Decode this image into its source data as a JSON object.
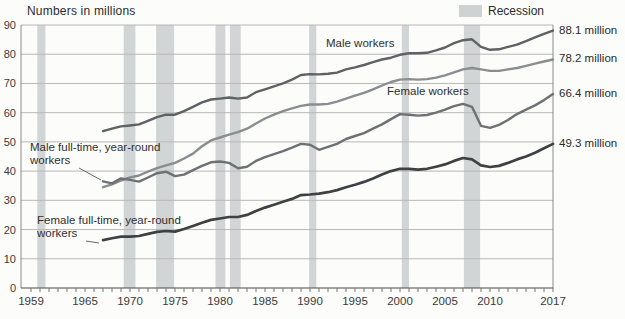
{
  "title": "Numbers in millions",
  "legend": {
    "label": "Recession",
    "swatch_color": "#cfd2d2"
  },
  "labels": {
    "male_workers": "Male workers",
    "female_workers": "Female workers",
    "male_ftyr_l1": "Male full-time, year-round",
    "male_ftyr_l2": "workers",
    "female_ftyr_l1": "Female full-time, year-round",
    "female_ftyr_l2": "workers"
  },
  "colors": {
    "recession_band": "#d2d5d5",
    "gridline": "#b8b8b8",
    "axis": "#8a8a8a",
    "baseline": "#4a4a4a",
    "tick_text": "#3a3a3a",
    "leader": "#6a6a6a"
  },
  "chart_data": {
    "type": "line",
    "title": "Numbers in millions",
    "xlabel": "",
    "ylabel": "Numbers in millions",
    "x_start_year": 1967,
    "x_end_year": 2017,
    "x_axis_start": 1959,
    "x_tick_years": [
      1959,
      1965,
      1970,
      1975,
      1980,
      1985,
      1990,
      1995,
      2000,
      2005,
      2010,
      2017
    ],
    "minor_tick_step": 1,
    "y_ticks": [
      0,
      10,
      20,
      30,
      40,
      50,
      60,
      70,
      80,
      90
    ],
    "ylim": [
      0,
      90
    ],
    "grid": true,
    "legend_position": "top-right",
    "recession_spans": [
      [
        1959.7,
        1960.6
      ],
      [
        1969.3,
        1970.6
      ],
      [
        1972.9,
        1974.9
      ],
      [
        1979.5,
        1980.6
      ],
      [
        1981.1,
        1982.3
      ],
      [
        1989.9,
        1990.7
      ],
      [
        2000.2,
        2001.0
      ],
      [
        2007.1,
        2008.9
      ]
    ],
    "series": [
      {
        "name": "Male workers",
        "end_label": "88.1 million",
        "end_value": 88.1,
        "color": "#5f6264",
        "width": 2.4,
        "values": [
          53.7,
          54.5,
          55.3,
          55.6,
          56.0,
          57.2,
          58.5,
          59.3,
          59.3,
          60.5,
          62.0,
          63.5,
          64.5,
          64.8,
          65.2,
          64.8,
          65.2,
          67.0,
          68.0,
          69.0,
          70.0,
          71.3,
          72.9,
          73.2,
          73.1,
          73.3,
          73.7,
          74.8,
          75.5,
          76.3,
          77.3,
          78.2,
          78.8,
          79.8,
          80.3,
          80.3,
          80.5,
          81.3,
          82.3,
          83.8,
          84.8,
          85.1,
          82.5,
          81.5,
          81.7,
          82.5,
          83.3,
          84.5,
          85.8,
          87.0,
          88.1
        ]
      },
      {
        "name": "Female workers",
        "end_label": "78.2 million",
        "end_value": 78.2,
        "color": "#8a8d8f",
        "width": 2.4,
        "values": [
          34.5,
          35.5,
          36.8,
          37.8,
          38.5,
          39.8,
          41.0,
          42.0,
          42.8,
          44.3,
          46.0,
          48.5,
          50.5,
          51.5,
          52.5,
          53.3,
          54.5,
          56.3,
          58.0,
          59.3,
          60.5,
          61.5,
          62.3,
          62.8,
          62.8,
          63.0,
          63.8,
          64.8,
          65.8,
          66.8,
          68.0,
          69.3,
          70.5,
          71.3,
          71.5,
          71.3,
          71.5,
          72.0,
          72.8,
          73.8,
          74.8,
          75.3,
          74.8,
          74.3,
          74.3,
          74.8,
          75.3,
          76.0,
          76.8,
          77.5,
          78.2
        ]
      },
      {
        "name": "Male full-time, year-round workers",
        "end_label": "66.4 million",
        "end_value": 66.4,
        "color": "#6e7173",
        "width": 2.4,
        "values": [
          36.5,
          35.8,
          37.5,
          37.0,
          36.4,
          37.8,
          39.3,
          39.8,
          38.3,
          38.8,
          40.3,
          41.8,
          43.0,
          43.3,
          42.8,
          41.0,
          41.5,
          43.5,
          44.8,
          45.8,
          46.8,
          48.0,
          49.3,
          49.0,
          47.3,
          48.3,
          49.3,
          51.0,
          52.0,
          53.0,
          54.5,
          56.0,
          57.8,
          59.5,
          59.3,
          59.0,
          59.2,
          60.0,
          61.0,
          62.2,
          63.0,
          62.0,
          55.5,
          54.8,
          55.8,
          57.5,
          59.5,
          61.0,
          62.5,
          64.3,
          66.4
        ]
      },
      {
        "name": "Female full-time, year-round workers",
        "end_label": "49.3 million",
        "end_value": 49.3,
        "color": "#3e4143",
        "width": 2.7,
        "values": [
          16.4,
          17.0,
          17.6,
          17.6,
          17.8,
          18.5,
          19.2,
          19.5,
          19.3,
          20.2,
          21.2,
          22.3,
          23.3,
          23.8,
          24.3,
          24.3,
          25.0,
          26.3,
          27.5,
          28.5,
          29.5,
          30.5,
          31.8,
          32.0,
          32.3,
          32.8,
          33.5,
          34.5,
          35.3,
          36.3,
          37.5,
          38.8,
          40.0,
          40.8,
          40.8,
          40.5,
          40.8,
          41.5,
          42.3,
          43.5,
          44.5,
          44.0,
          42.0,
          41.4,
          41.8,
          42.8,
          44.0,
          45.0,
          46.3,
          47.8,
          49.3
        ]
      }
    ],
    "leader_lines": [
      [
        79,
        168,
        101,
        180
      ],
      [
        86,
        241,
        99,
        243
      ]
    ]
  }
}
